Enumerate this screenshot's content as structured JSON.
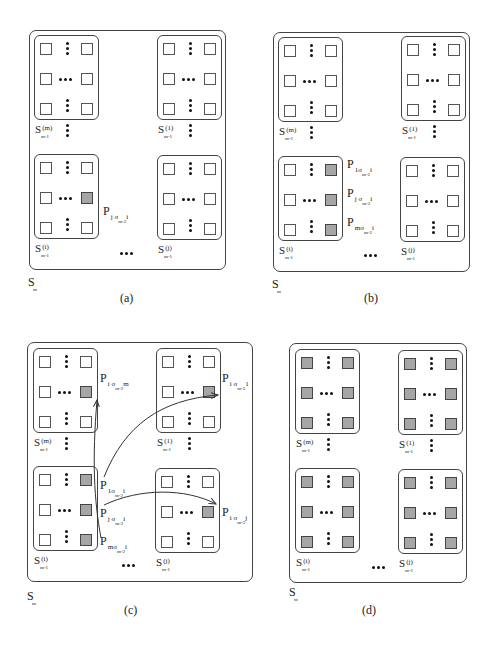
{
  "figure": {
    "colors": {
      "line": "#444444",
      "highlight_fill": "#a6a6a6",
      "empty_fill": "#ffffff"
    }
  },
  "panels": [
    {
      "id": "a",
      "caption": "(a)",
      "outer_label": {
        "base": "S",
        "sub": "m"
      },
      "blocks": [
        {
          "pos": "top-left",
          "label": {
            "base": "S",
            "sup": "(m)",
            "sub": "m-1"
          },
          "highlighted": []
        },
        {
          "pos": "top-right",
          "label": {
            "base": "S",
            "sup": "(1)",
            "sub": "m-1"
          },
          "highlighted": []
        },
        {
          "pos": "bottom-left",
          "label": {
            "base": "S",
            "sup": "(i)",
            "sub": "m-1"
          },
          "highlighted": [
            "mid-right"
          ]
        },
        {
          "pos": "bottom-right",
          "label": {
            "base": "S",
            "sup": "(j)",
            "sub": "m-1"
          },
          "highlighted": []
        }
      ],
      "p_labels": [
        {
          "base": "P",
          "s1": "j σ",
          "s2": "m-2",
          "s3": "i"
        }
      ]
    },
    {
      "id": "b",
      "caption": "(b)",
      "outer_label": {
        "base": "S",
        "sub": "m"
      },
      "blocks": [
        {
          "pos": "top-left",
          "label": {
            "base": "S",
            "sup": "(m)",
            "sub": "m-1"
          },
          "highlighted": []
        },
        {
          "pos": "top-right",
          "label": {
            "base": "S",
            "sup": "(1)",
            "sub": "m-1"
          },
          "highlighted": []
        },
        {
          "pos": "bottom-left",
          "label": {
            "base": "S",
            "sup": "(i)",
            "sub": "m-1"
          },
          "highlighted": [
            "top-right",
            "mid-right",
            "bottom-right"
          ]
        },
        {
          "pos": "bottom-right",
          "label": {
            "base": "S",
            "sup": "(j)",
            "sub": "m-1"
          },
          "highlighted": []
        }
      ],
      "p_labels": [
        {
          "base": "P",
          "s1": "1σ",
          "s2": "m-2",
          "s3": "i"
        },
        {
          "base": "P",
          "s1": "j σ",
          "s2": "m-2",
          "s3": "i"
        },
        {
          "base": "P",
          "s1": "mσ",
          "s2": "m-2",
          "s3": "i"
        }
      ]
    },
    {
      "id": "c",
      "caption": "(c)",
      "outer_label": {
        "base": "S",
        "sub": "m"
      },
      "blocks": [
        {
          "pos": "top-left",
          "label": {
            "base": "S",
            "sup": "(m)",
            "sub": "m-1"
          },
          "highlighted": [
            "mid-right"
          ]
        },
        {
          "pos": "top-right",
          "label": {
            "base": "S",
            "sup": "(1)",
            "sub": "m-1"
          },
          "highlighted": [
            "mid-right"
          ]
        },
        {
          "pos": "bottom-left",
          "label": {
            "base": "S",
            "sup": "(i)",
            "sub": "m-1"
          },
          "highlighted": [
            "top-right",
            "mid-right",
            "bottom-right"
          ]
        },
        {
          "pos": "bottom-right",
          "label": {
            "base": "S",
            "sup": "(j)",
            "sub": "m-1"
          },
          "highlighted": [
            "mid-right"
          ]
        }
      ],
      "p_labels": [
        {
          "base": "P",
          "s1": "i σ",
          "s2": "m-2",
          "s3": "m"
        },
        {
          "base": "P",
          "s1": "i σ",
          "s2": "m-2",
          "s3": "1"
        },
        {
          "base": "P",
          "s1": "1σ",
          "s2": "m-2",
          "s3": "i"
        },
        {
          "base": "P",
          "s1": "j σ",
          "s2": "m-2",
          "s3": "i"
        },
        {
          "base": "P",
          "s1": "mσ",
          "s2": "m-2",
          "s3": "i"
        },
        {
          "base": "P",
          "s1": "i σ",
          "s2": "m-2",
          "s3": "j"
        }
      ],
      "arrows": [
        {
          "from": "P_{mσ_{m-2} i}",
          "to": "P_{iσ_{m-2} m}"
        },
        {
          "from": "P_{1σ_{m-2} i}",
          "to": "P_{iσ_{m-2} 1}"
        },
        {
          "from": "P_{jσ_{m-2} i}",
          "to": "P_{iσ_{m-2} j}"
        }
      ]
    },
    {
      "id": "d",
      "caption": "(d)",
      "outer_label": {
        "base": "S",
        "sub": "m"
      },
      "blocks": [
        {
          "pos": "top-left",
          "label": {
            "base": "S",
            "sup": "(m)",
            "sub": "m-1"
          },
          "highlighted": [
            "all"
          ]
        },
        {
          "pos": "top-right",
          "label": {
            "base": "S",
            "sup": "(1)",
            "sub": "m-1"
          },
          "highlighted": [
            "all"
          ]
        },
        {
          "pos": "bottom-left",
          "label": {
            "base": "S",
            "sup": "(i)",
            "sub": "m-1"
          },
          "highlighted": [
            "all"
          ]
        },
        {
          "pos": "bottom-right",
          "label": {
            "base": "S",
            "sup": "(j)",
            "sub": "m-1"
          },
          "highlighted": [
            "all"
          ]
        }
      ],
      "p_labels": []
    }
  ]
}
